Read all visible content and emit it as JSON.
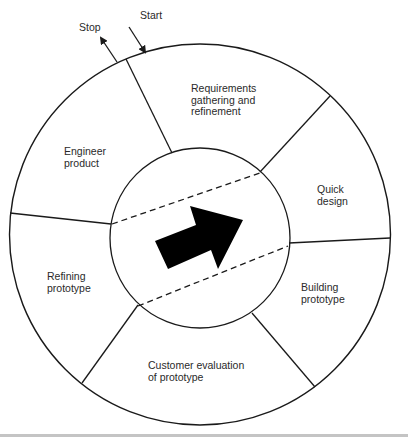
{
  "diagram": {
    "entry_labels": {
      "start": "Start",
      "stop": "Stop"
    },
    "phases": [
      {
        "id": "requirements",
        "lines": [
          "Requirements",
          "gathering and",
          "refinement"
        ]
      },
      {
        "id": "quick-design",
        "lines": [
          "Quick",
          "design"
        ]
      },
      {
        "id": "building-prototype",
        "lines": [
          "Building",
          "prototype"
        ]
      },
      {
        "id": "customer-evaluation",
        "lines": [
          "Customer evaluation",
          "of prototype"
        ]
      },
      {
        "id": "refining-prototype",
        "lines": [
          "Refining",
          "prototype"
        ]
      },
      {
        "id": "engineer-product",
        "lines": [
          "Engineer",
          "product"
        ]
      }
    ],
    "center_symbol": "right-up-arrow-icon",
    "colors": {
      "stroke": "#1a1a1a",
      "fill_arrow": "#000000",
      "text": "#2a2a2a",
      "background": "#ffffff",
      "bottom_bar": "#c4c4c4"
    }
  }
}
